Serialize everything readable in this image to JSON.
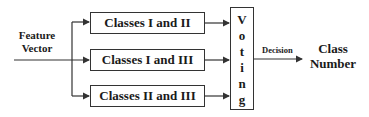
{
  "input": {
    "line1": "Feature",
    "line2": "Vector"
  },
  "classifiers": [
    {
      "label": "Classes I and II"
    },
    {
      "label": "Classes I and III"
    },
    {
      "label": "Classes II and III"
    }
  ],
  "voting": {
    "letters": [
      "V",
      "o",
      "t",
      "i",
      "n",
      "g"
    ]
  },
  "decision_label": "Decision",
  "output": {
    "line1": "Class",
    "line2": "Number"
  }
}
